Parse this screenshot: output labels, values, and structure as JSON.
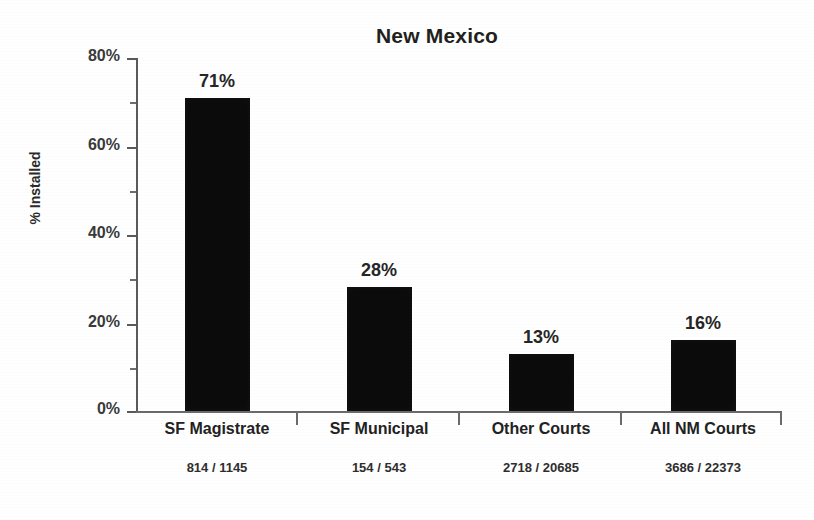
{
  "chart_data": {
    "type": "bar",
    "title": "New Mexico",
    "xlabel": "",
    "ylabel": "% Installed",
    "ylim": [
      0,
      80
    ],
    "grid": false,
    "legend": false,
    "y_ticks": [
      "0%",
      "20%",
      "40%",
      "60%",
      "80%"
    ],
    "y_tick_values": [
      0,
      20,
      40,
      60,
      80
    ],
    "y_minor_tick_values": [
      10,
      30,
      50,
      70
    ],
    "categories": [
      "SF Magistrate",
      "SF Municipal",
      "Other Courts",
      "All NM Courts"
    ],
    "values": [
      71,
      28,
      13,
      16
    ],
    "value_labels": [
      "71%",
      "28%",
      "13%",
      "16%"
    ],
    "sub_labels": [
      "814 / 1145",
      "154 /  543",
      "2718 / 20685",
      "3686 /  22373"
    ],
    "numerators": [
      814,
      154,
      2718,
      3686
    ],
    "denominators": [
      1145,
      543,
      20685,
      22373
    ],
    "bar_color": "#0b0b0b",
    "axis_color": "#5a5a5a",
    "background_color": "#ffffff"
  }
}
